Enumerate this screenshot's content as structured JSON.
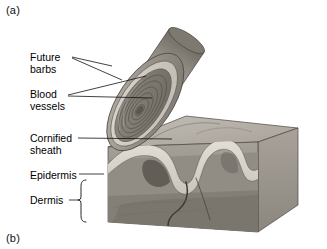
{
  "figure": {
    "panel_a_label": "(a)",
    "panel_b_label": "(b)",
    "palette": {
      "background": "#ffffff",
      "text": "#000000",
      "leader_line": "#111111",
      "epidermis_band": "#d9d5cc",
      "dermis_light": "#a9a39a",
      "dermis_mid": "#8e887f",
      "dermis_dark": "#6f6a62",
      "block_top": "#b9b4ab",
      "block_side": "#9a958c",
      "feather_outer": "#8d8880",
      "feather_sheath": "#cfcac1",
      "feather_inner": "#7a756d",
      "feather_core": "#6a655e",
      "blood_vessel": "#3b3733"
    }
  },
  "labels": {
    "future_barbs": "Future\nbarbs",
    "future_barbs_line1": "Future",
    "future_barbs_line2": "barbs",
    "blood_vessels_line1": "Blood",
    "blood_vessels_line2": "vessels",
    "cornified_sheath_line1": "Cornified",
    "cornified_sheath_line2": "sheath",
    "epidermis": "Epidermis",
    "dermis": "Dermis"
  },
  "annotations": {
    "leader_count": 7,
    "bracket": "dermis-curly-brace"
  }
}
